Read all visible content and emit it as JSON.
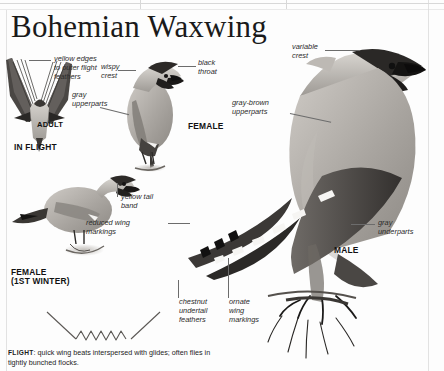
{
  "page": {
    "title": "Bohemian Waxwing",
    "background_color": "#fdfdfd",
    "ink_color": "#231f20"
  },
  "labels": [
    {
      "name": "yellow-edges",
      "text": "yellow edges\nto outer flight\nfeathers"
    },
    {
      "name": "wispy-crest",
      "text": "wispy\ncrest"
    },
    {
      "name": "gray-upperparts",
      "text": "gray\nupperparts"
    },
    {
      "name": "black-throat",
      "text": "black\nthroat"
    },
    {
      "name": "variable-crest",
      "text": "variable\ncrest"
    },
    {
      "name": "gray-brown-upperparts",
      "text": "gray-brown\nupperparts"
    },
    {
      "name": "yellow-tail-band",
      "text": "yellow tail\nband"
    },
    {
      "name": "reduced-wing-markings",
      "text": "reduced wing\nmarkings"
    },
    {
      "name": "gray-underparts",
      "text": "gray\nunderparts"
    },
    {
      "name": "chestnut-undertail",
      "text": "chestnut\nundertail\nfeathers"
    },
    {
      "name": "ornate-wing-markings",
      "text": "ornate\nwing\nmarkings"
    }
  ],
  "captions": [
    {
      "name": "adult",
      "text": "ADULT"
    },
    {
      "name": "in-flight",
      "text": "IN FLIGHT"
    },
    {
      "name": "female",
      "text": "FEMALE"
    },
    {
      "name": "female-first-winter",
      "text": "FEMALE\n(1ST WINTER)"
    },
    {
      "name": "male",
      "text": "MALE"
    }
  ],
  "flight_note": {
    "heading": "FLIGHT",
    "separator": ": ",
    "text": "quick wing beats interspersed with glides; often flies in tightly bunched flocks."
  }
}
